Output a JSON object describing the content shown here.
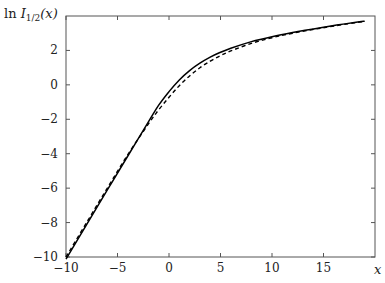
{
  "chart_data": {
    "type": "line",
    "title": "",
    "xlabel": "x",
    "ylabel": "ln I_{1/2}(x)",
    "ylabel_display": {
      "prefix": "ln ",
      "symbol": "I",
      "subscript": "1/2",
      "suffix": "(x)"
    },
    "xlim": [
      -10,
      20
    ],
    "ylim": [
      -10,
      4
    ],
    "xticks": [
      -10,
      -5,
      0,
      5,
      10,
      15
    ],
    "xtick_labels": [
      "−10",
      "−5",
      "0",
      "5",
      "10",
      "15"
    ],
    "yticks": [
      -10,
      -8,
      -6,
      -4,
      -2,
      0,
      2
    ],
    "ytick_labels": [
      "−10",
      "−8",
      "−6",
      "−4",
      "−2",
      "0",
      "2"
    ],
    "grid": false,
    "legend": null,
    "x": [
      -10,
      -8,
      -6,
      -4,
      -2,
      -1,
      0,
      1,
      2,
      3,
      4,
      5,
      6,
      8,
      10,
      12,
      15,
      18,
      19
    ],
    "series": [
      {
        "name": "exact",
        "style": "solid",
        "color": "#000000",
        "values": [
          -10.12,
          -8.12,
          -6.12,
          -4.13,
          -2.15,
          -1.18,
          -0.39,
          0.29,
          0.83,
          1.26,
          1.61,
          1.89,
          2.13,
          2.51,
          2.8,
          3.04,
          3.35,
          3.62,
          3.7
        ]
      },
      {
        "name": "approximation",
        "style": "dashed",
        "color": "#000000",
        "values": [
          -10.0,
          -8.0,
          -6.01,
          -4.05,
          -2.27,
          -1.45,
          -0.72,
          -0.05,
          0.52,
          0.99,
          1.38,
          1.7,
          1.97,
          2.41,
          2.74,
          3.0,
          3.32,
          3.6,
          3.69
        ]
      }
    ]
  }
}
